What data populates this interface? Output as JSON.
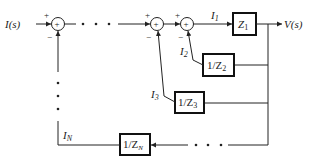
{
  "diagram": {
    "type": "block-diagram",
    "input_label": "I(s)",
    "output_label": "V(s)",
    "summing_junctions": [
      {
        "id": "sum1",
        "signs": {
          "left": "+",
          "bottom": "−"
        },
        "center_symbol": "+"
      },
      {
        "id": "sum2",
        "signs": {
          "left": "+",
          "bottom": "−"
        },
        "center_symbol": "+"
      },
      {
        "id": "sum3",
        "signs": {
          "left": "+",
          "bottom": "−"
        },
        "center_symbol": "+"
      }
    ],
    "blocks": [
      {
        "id": "z1",
        "label": "Z",
        "sub": "1"
      },
      {
        "id": "inv_z2",
        "label": "1/Z",
        "sub": "2"
      },
      {
        "id": "inv_z3",
        "label": "1/Z",
        "sub": "3"
      },
      {
        "id": "inv_zn",
        "label": "1/Z",
        "sub": "N"
      }
    ],
    "signals": [
      {
        "id": "i1",
        "label": "I",
        "sub": "1"
      },
      {
        "id": "i2",
        "label": "I",
        "sub": "2"
      },
      {
        "id": "i3",
        "label": "I",
        "sub": "3"
      },
      {
        "id": "in",
        "label": "I",
        "sub": "N"
      }
    ],
    "ellipsis": "• • •"
  }
}
